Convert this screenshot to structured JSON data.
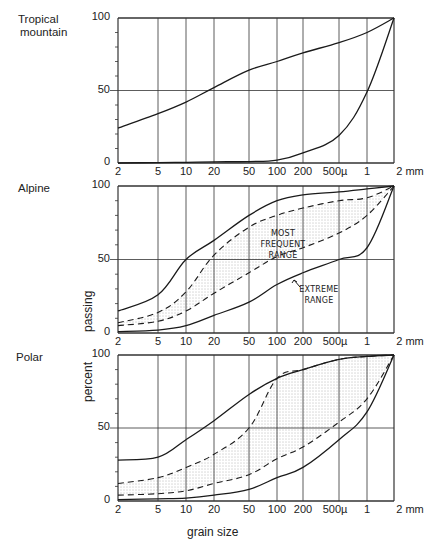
{
  "chart_data": {
    "type": "line",
    "title": "",
    "xlabel": "grain size",
    "ylabel": "percent passing",
    "x_scale": "log",
    "x_tick_labels": [
      "2",
      "5",
      "10",
      "20",
      "50",
      "100",
      "200",
      "500µ",
      "1",
      "2 mm"
    ],
    "x_tick_values_um": [
      2,
      5,
      10,
      20,
      50,
      100,
      200,
      500,
      1000,
      2000
    ],
    "y_ticks": [
      "0",
      "50",
      "100"
    ],
    "ylim": [
      0,
      100
    ],
    "grid": true,
    "panels": [
      {
        "name": "Tropical mountain",
        "series": [
          {
            "name": "upper envelope",
            "style": "solid",
            "values": [
              24,
              34,
              42,
              52,
              64,
              70,
              76,
              83,
              90,
              100
            ]
          },
          {
            "name": "lower envelope",
            "style": "solid",
            "values": [
              0,
              0.3,
              0.5,
              0.8,
              1,
              2,
              7,
              19,
              49,
              100
            ]
          }
        ],
        "shaded": false
      },
      {
        "name": "Alpine",
        "series": [
          {
            "name": "extreme range upper",
            "style": "solid",
            "values": [
              15,
              26,
              50,
              63,
              80,
              90,
              94,
              96,
              98,
              100
            ]
          },
          {
            "name": "most frequent range upper",
            "style": "dashed",
            "values": [
              7,
              14,
              28,
              53,
              72,
              80,
              85,
              90,
              92,
              100
            ]
          },
          {
            "name": "most frequent range lower",
            "style": "dashed",
            "values": [
              5,
              8,
              15,
              27,
              41,
              52,
              58,
              68,
              80,
              100
            ]
          },
          {
            "name": "extreme range lower",
            "style": "solid",
            "values": [
              1,
              2,
              5,
              12,
              21,
              33,
              41,
              50,
              58,
              100
            ]
          }
        ],
        "shaded": true,
        "annotations": [
          "MOST FREQUENT RANGE",
          "EXTREME RANGE"
        ]
      },
      {
        "name": "Polar",
        "series": [
          {
            "name": "extreme range upper",
            "style": "solid",
            "values": [
              28,
              30,
              42,
              55,
              73,
              84,
              90,
              97,
              99,
              100
            ]
          },
          {
            "name": "most frequent range upper",
            "style": "dashed",
            "values": [
              12,
              16,
              23,
              32,
              50,
              84,
              90,
              97,
              99,
              100
            ]
          },
          {
            "name": "most frequent range lower",
            "style": "dashed",
            "values": [
              4,
              5,
              7,
              12,
              18,
              29,
              37,
              54,
              70,
              100
            ]
          },
          {
            "name": "extreme range lower",
            "style": "solid",
            "values": [
              1,
              1.5,
              2,
              4,
              8,
              16,
              23,
              42,
              61,
              100
            ]
          }
        ],
        "shaded": true
      }
    ]
  },
  "labels": {
    "panel_titles": [
      "Tropical\nmountain",
      "Alpine",
      "Polar"
    ],
    "ylabel_top": "passing",
    "ylabel_bottom": "percent",
    "xlabel": "grain size",
    "annotation_most_frequent_1": "MOST FREQUENT",
    "annotation_most_frequent_2": "RANGE",
    "annotation_extreme_1": "EXTREME",
    "annotation_extreme_2": "RANGE"
  },
  "colors": {
    "line": "#1a1a1a",
    "grid": "#333333",
    "stipple": "#6a6a6a",
    "background": "#ffffff"
  }
}
